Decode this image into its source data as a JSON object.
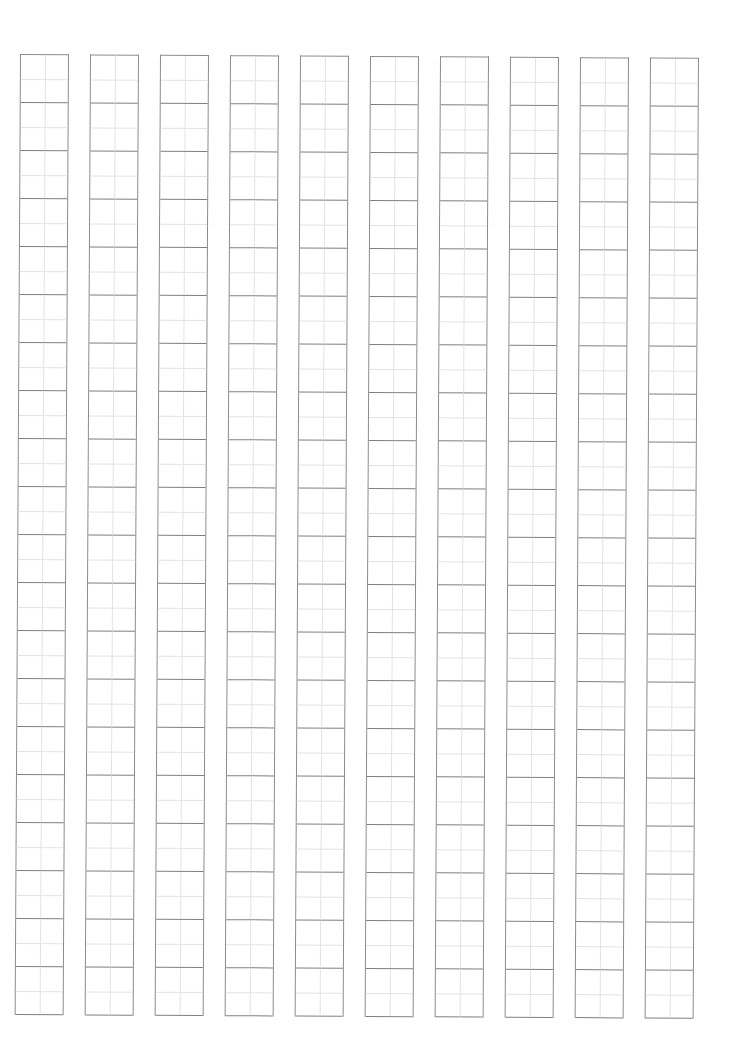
{
  "document": {
    "type": "tianzige-practice-sheet",
    "columns": 10,
    "rows_per_column": 20,
    "cell_style": "field-grid (4 quadrants, light center guides)",
    "colors": {
      "background": "#ffffff",
      "outer_line": "#8c8c8c",
      "guide_line": "#e3e3e3"
    },
    "geometry": {
      "column_width": 47,
      "column_pitch": 70,
      "cell_height": 48,
      "origin_x": 20,
      "origin_y": 54
    },
    "text": []
  }
}
